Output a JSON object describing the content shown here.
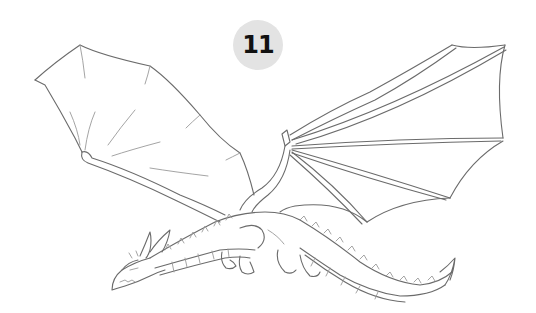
{
  "image": {
    "subject": "Pencil line sketch of a flying dragon with wings spread, step 11 of a drawing tutorial",
    "background_color": "#ffffff",
    "line_color": "#6b6b6b"
  },
  "badge": {
    "step_number": "11",
    "background_color": "#e3e3e3",
    "text_color": "#111111"
  }
}
